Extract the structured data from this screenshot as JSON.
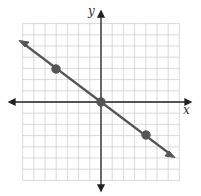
{
  "chart_data": {
    "type": "line",
    "title": "",
    "xlabel": "x",
    "ylabel": "y",
    "xlim": [
      -7,
      7
    ],
    "ylim": [
      -7,
      7
    ],
    "grid": true,
    "series": [
      {
        "name": "line",
        "x": [
          -4,
          0,
          4
        ],
        "y": [
          3,
          0,
          -3
        ],
        "slope": -0.75
      }
    ],
    "points": [
      {
        "x": -4,
        "y": 3
      },
      {
        "x": 0,
        "y": 0
      },
      {
        "x": 4,
        "y": -3
      }
    ],
    "colors": {
      "line": "#555555",
      "grid": "#cccccc",
      "axis": "#222222"
    }
  },
  "axes": {
    "x_label": "x",
    "y_label": "y"
  }
}
